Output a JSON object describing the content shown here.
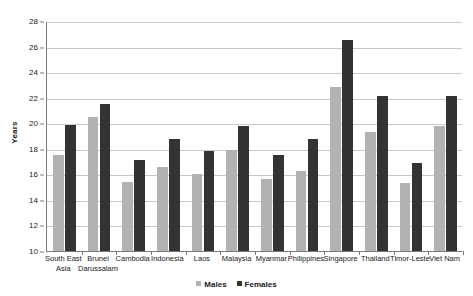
{
  "chart_data": {
    "type": "bar",
    "title": "",
    "xlabel": "",
    "ylabel": "Years",
    "ylim": [
      10,
      28
    ],
    "ytick_step": 2,
    "yticks": [
      10,
      12,
      14,
      16,
      18,
      20,
      22,
      24,
      26,
      28
    ],
    "grid": true,
    "legend_position": "bottom",
    "categories": [
      "South East Asia",
      "Brunei Darussalam",
      "Cambodia",
      "Indonesia",
      "Laos",
      "Malaysia",
      "Myanmar",
      "Philippines",
      "Singapore",
      "Thailand",
      "Timor-Leste",
      "Viet Nam"
    ],
    "series": [
      {
        "name": "Males",
        "color": "#b2b2b2",
        "values": [
          17.5,
          20.5,
          15.4,
          16.6,
          16.0,
          17.9,
          15.6,
          16.3,
          22.8,
          19.3,
          15.3,
          19.8
        ]
      },
      {
        "name": "Females",
        "color": "#333333",
        "values": [
          19.9,
          21.5,
          17.1,
          18.8,
          17.8,
          19.8,
          17.5,
          18.8,
          26.5,
          22.1,
          16.9,
          22.1
        ]
      }
    ]
  },
  "axis": {
    "y_title": "Years"
  },
  "legend": {
    "items": [
      {
        "label": "Males",
        "color": "#b2b2b2"
      },
      {
        "label": "Females",
        "color": "#333333"
      }
    ]
  }
}
